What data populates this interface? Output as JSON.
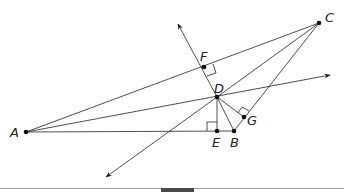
{
  "diagram": {
    "type": "geometry",
    "points": {
      "A": {
        "label": "A",
        "x": 26,
        "y": 132
      },
      "B": {
        "label": "B",
        "x": 234,
        "y": 131
      },
      "C": {
        "label": "C",
        "x": 319,
        "y": 23
      },
      "D": {
        "label": "D",
        "x": 217,
        "y": 97
      },
      "E": {
        "label": "E",
        "x": 217,
        "y": 131
      },
      "F": {
        "label": "F",
        "x": 204,
        "y": 67
      },
      "G": {
        "label": "G",
        "x": 244,
        "y": 117
      }
    },
    "segments": [
      "AB",
      "AC",
      "BC",
      "AD",
      "CD",
      "DB",
      "DE",
      "DG"
    ],
    "rays": [
      {
        "from": "D",
        "through": "F",
        "arrow_end": [
          178,
          24
        ]
      },
      {
        "from": "D",
        "direction": "down-left",
        "arrow_end": [
          106,
          177
        ]
      },
      {
        "from": "A",
        "through": "D",
        "arrow_end": [
          330,
          75
        ]
      }
    ],
    "right_angles": [
      "E",
      "F",
      "G"
    ],
    "labels": [
      "A",
      "B",
      "C",
      "D",
      "E",
      "F",
      "G"
    ]
  }
}
